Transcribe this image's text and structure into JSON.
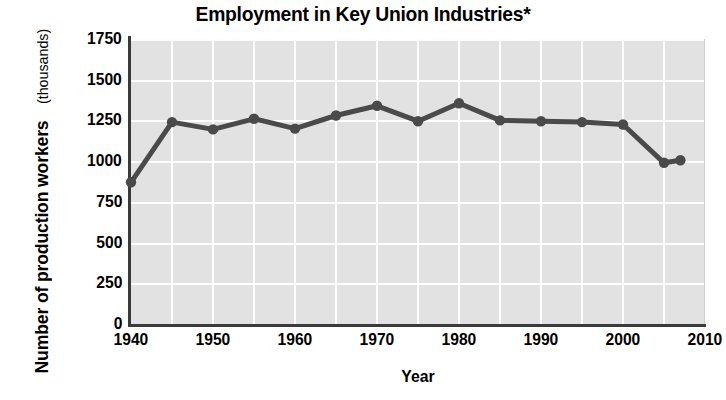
{
  "chart_data": {
    "type": "line",
    "title": "Employment in Key Union Industries*",
    "xlabel": "Year",
    "ylabel": "Number of production workers",
    "ylabel_sub": "(thousands)",
    "xlim": [
      1940,
      2010
    ],
    "ylim": [
      0,
      1750
    ],
    "grid": true,
    "legend": "none",
    "xticks": [
      1940,
      1950,
      1960,
      1970,
      1980,
      1990,
      2000,
      2010
    ],
    "yticks": [
      0,
      250,
      500,
      750,
      1000,
      1250,
      1500,
      1750
    ],
    "x_gridline_step": 5,
    "series": [
      {
        "name": "Number of production workers (thousands)",
        "color": "#4a4a4a",
        "marker": "circle",
        "x": [
          1940,
          1945,
          1950,
          1955,
          1960,
          1965,
          1970,
          1975,
          1980,
          1985,
          1990,
          1995,
          2000,
          2005,
          2007
        ],
        "values": [
          870,
          1240,
          1195,
          1260,
          1200,
          1280,
          1340,
          1245,
          1355,
          1250,
          1245,
          1240,
          1225,
          990,
          1005
        ]
      }
    ]
  },
  "axis": {
    "ytick_labels": [
      "1750",
      "1500",
      "1250",
      "1000",
      "750",
      "500",
      "250",
      "0"
    ],
    "xtick_labels": [
      "1940",
      "1950",
      "1960",
      "1970",
      "1980",
      "1990",
      "2000",
      "2010"
    ]
  },
  "colors": {
    "plot_background": "#e2e2e2",
    "gridline": "#fdfdfd",
    "axis": "#3a3a3a",
    "series": "#4a4a4a",
    "text": "#000000"
  }
}
